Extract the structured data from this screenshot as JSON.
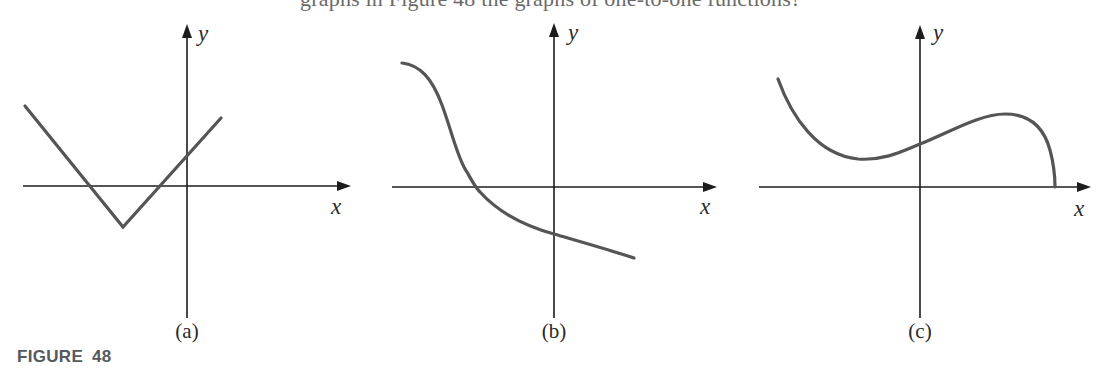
{
  "header": {
    "clipped_text": "graphs in Figure 48 the graphs of one-to-one functions?"
  },
  "figure": {
    "caption": "FIGURE 48",
    "colors": {
      "axis": "#1c1c1c",
      "curve": "#555555",
      "caption": "#555a5e"
    },
    "panels": [
      {
        "id": "a",
        "label": "(a)",
        "x_label": "x",
        "y_label": "y",
        "curve_type": "V-shaped absolute value graph (piecewise linear)",
        "description": "V-shaped graph with vertex below x-axis, left of y-axis; crosses x-axis twice, crosses y-axis above origin"
      },
      {
        "id": "b",
        "label": "(b)",
        "x_label": "x",
        "y_label": "y",
        "curve_type": "strictly decreasing smooth curve",
        "description": "Decreasing curve starting high on the left, crossing x-axis left of origin, crossing y-axis below origin"
      },
      {
        "id": "c",
        "label": "(c)",
        "x_label": "x",
        "y_label": "y",
        "curve_type": "smooth curve with local min and local max",
        "description": "Curve decreasing to a local minimum left of y-axis, rising to local maximum right of y-axis, then falling sharply to meet the x-axis"
      }
    ]
  }
}
